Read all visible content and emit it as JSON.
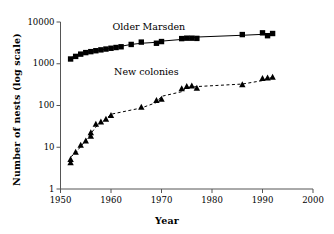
{
  "chart_data": {
    "type": "scatter",
    "title": "",
    "xlabel": "Year",
    "ylabel": "Number of nests (log scale)",
    "yscale": "log",
    "xlim": [
      1950,
      2000
    ],
    "ylim": [
      1,
      10000
    ],
    "grid": false,
    "legend_position": "inline-annotations",
    "xticks": [
      1950,
      1960,
      1970,
      1980,
      1990,
      2000
    ],
    "xtick_labels": [
      "1950",
      "1960",
      "1970",
      "1980",
      "1990",
      "2000"
    ],
    "yticks": [
      1,
      10,
      100,
      1000,
      10000
    ],
    "ytick_labels": [
      "1",
      "10",
      "100",
      "1000",
      "10000"
    ],
    "annotations": [
      {
        "text": "Older Marsden",
        "x": 1967.5,
        "y": 7600
      },
      {
        "text": "New colonies",
        "x": 1967.0,
        "y": 620
      }
    ],
    "series": [
      {
        "name": "Older Marsden",
        "marker": "square",
        "line": "solid",
        "color": "#000000",
        "points": [
          {
            "x": 1952,
            "y": 1300
          },
          {
            "x": 1953,
            "y": 1500
          },
          {
            "x": 1954,
            "y": 1700
          },
          {
            "x": 1955,
            "y": 1850
          },
          {
            "x": 1956,
            "y": 1950
          },
          {
            "x": 1957,
            "y": 2050
          },
          {
            "x": 1958,
            "y": 2150
          },
          {
            "x": 1959,
            "y": 2250
          },
          {
            "x": 1960,
            "y": 2350
          },
          {
            "x": 1961,
            "y": 2450
          },
          {
            "x": 1962,
            "y": 2550
          },
          {
            "x": 1964,
            "y": 2900
          },
          {
            "x": 1966,
            "y": 3300
          },
          {
            "x": 1969,
            "y": 3100
          },
          {
            "x": 1970,
            "y": 3400
          },
          {
            "x": 1974,
            "y": 4000
          },
          {
            "x": 1975,
            "y": 4100
          },
          {
            "x": 1976,
            "y": 4100
          },
          {
            "x": 1977,
            "y": 4050
          },
          {
            "x": 1986,
            "y": 5000
          },
          {
            "x": 1990,
            "y": 5500
          },
          {
            "x": 1991,
            "y": 4700
          },
          {
            "x": 1992,
            "y": 5300
          }
        ]
      },
      {
        "name": "New colonies",
        "marker": "triangle",
        "line": "dashed",
        "color": "#000000",
        "points": [
          {
            "x": 1952,
            "y": 4.2
          },
          {
            "x": 1952,
            "y": 5.0
          },
          {
            "x": 1953,
            "y": 7.5
          },
          {
            "x": 1954,
            "y": 11
          },
          {
            "x": 1955,
            "y": 14
          },
          {
            "x": 1956,
            "y": 18
          },
          {
            "x": 1956,
            "y": 22
          },
          {
            "x": 1957,
            "y": 35
          },
          {
            "x": 1958,
            "y": 40
          },
          {
            "x": 1959,
            "y": 46
          },
          {
            "x": 1960,
            "y": 57
          },
          {
            "x": 1966,
            "y": 90
          },
          {
            "x": 1969,
            "y": 130
          },
          {
            "x": 1970,
            "y": 140
          },
          {
            "x": 1974,
            "y": 250
          },
          {
            "x": 1975,
            "y": 280
          },
          {
            "x": 1976,
            "y": 290
          },
          {
            "x": 1977,
            "y": 255
          },
          {
            "x": 1986,
            "y": 310
          },
          {
            "x": 1990,
            "y": 440
          },
          {
            "x": 1991,
            "y": 450
          },
          {
            "x": 1992,
            "y": 470
          }
        ]
      }
    ]
  }
}
